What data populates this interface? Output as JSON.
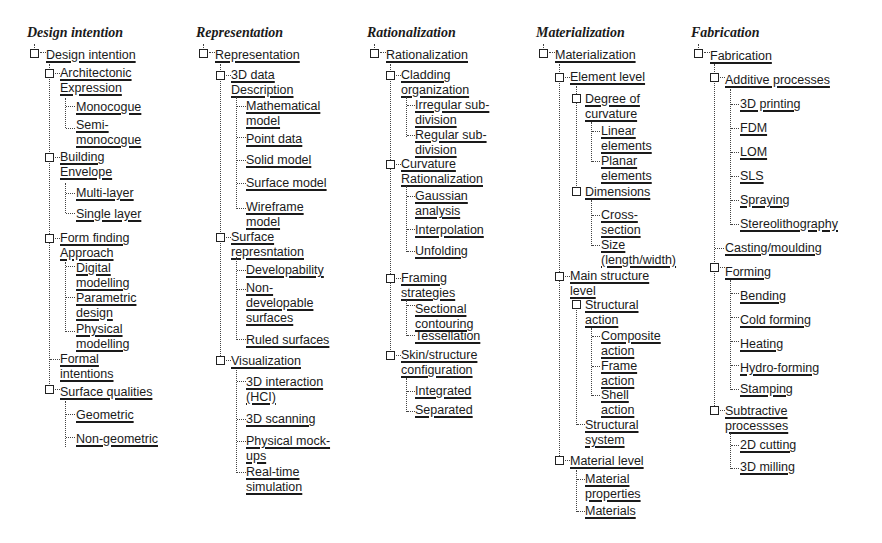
{
  "columns": [
    {
      "heading": "Design intention",
      "root": "Design intention",
      "nodes": [
        {
          "label": "Architectonic\nExpression",
          "children": [
            "Monocogue",
            "Semi-\nmonocogue"
          ]
        },
        {
          "label": "Building\nEnvelope",
          "children": [
            "Multi-layer",
            "Single layer"
          ]
        },
        {
          "label": "Form finding\nApproach",
          "children": [
            "Digital\nmodelling",
            "Parametric\ndesign",
            "Physical\nmodelling"
          ]
        },
        {
          "label": "Formal\nintentions",
          "children": []
        },
        {
          "label": "Surface qualities",
          "children": [
            "Geometric",
            "Non-geometric"
          ]
        }
      ]
    },
    {
      "heading": "Representation",
      "root": "Representation",
      "nodes": [
        {
          "label": "3D data\nDescription",
          "children": [
            "Mathematical\nmodel",
            "Point data",
            "Solid model",
            "Surface model",
            "Wireframe\nmodel"
          ]
        },
        {
          "label": "Surface\nrepresntation",
          "children": [
            "Developability",
            "Non-\ndevelopable\nsurfaces",
            "Ruled surfaces"
          ]
        },
        {
          "label": "Visualization",
          "children": [
            "3D interaction\n(HCI)",
            "3D scanning",
            "Physical mock-\nups",
            "Real-time\nsimulation"
          ]
        }
      ]
    },
    {
      "heading": "Rationalization",
      "root": "Rationalization",
      "nodes": [
        {
          "label": "Cladding\norganization",
          "children": [
            "Irregular sub-\ndivision",
            "Regular sub-\ndivision"
          ]
        },
        {
          "label": "Curvature\nRationalization",
          "children": [
            "Gaussian\nanalysis",
            "Interpolation",
            "Unfolding"
          ]
        },
        {
          "label": "Framing\nstrategies",
          "children": [
            "Sectional\ncontouring",
            "Tessellation"
          ]
        },
        {
          "label": "Skin/structure\nconfiguration",
          "children": [
            "Integrated",
            "Separated"
          ]
        }
      ]
    },
    {
      "heading": "Materialization",
      "root": "Materialization",
      "nodes": [
        {
          "label": "Element level",
          "sub": [
            {
              "label": "Degree of\ncurvature",
              "children": [
                "Linear\nelements",
                "Planar\nelements"
              ]
            },
            {
              "label": "Dimensions",
              "children": [
                "Cross-\nsection",
                "Size\n(length/width)"
              ]
            }
          ]
        },
        {
          "label": "Main structure\nlevel",
          "sub": [
            {
              "label": "Structural\naction",
              "children": [
                "Composite\naction",
                "Frame\naction",
                "Shell\naction"
              ]
            },
            {
              "label": "Structural\nsystem",
              "children": []
            }
          ]
        },
        {
          "label": "Material level",
          "children": [
            "Material\nproperties",
            "Materials"
          ]
        }
      ]
    },
    {
      "heading": "Fabrication",
      "root": "Fabrication",
      "nodes": [
        {
          "label": "Additive processes",
          "children": [
            "3D printing",
            "FDM",
            "LOM",
            "SLS",
            "Spraying",
            "Stereolithography"
          ]
        },
        {
          "label": "Casting/moulding",
          "children": []
        },
        {
          "label": "Forming",
          "children": [
            "Bending",
            "Cold forming",
            "Heating",
            "Hydro-forming",
            "Stamping"
          ]
        },
        {
          "label": "Subtractive\nprocessses",
          "children": [
            "2D cutting",
            "3D milling"
          ]
        }
      ]
    }
  ]
}
